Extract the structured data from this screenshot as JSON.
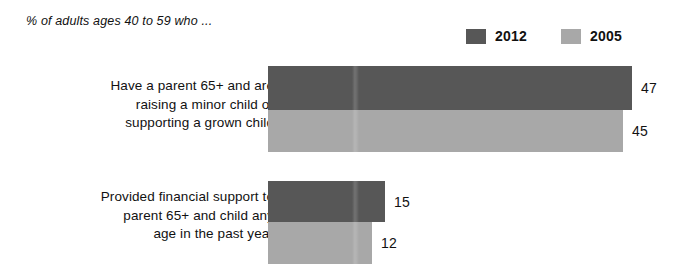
{
  "subtitle": "% of adults ages 40 to 59 who ...",
  "legend": {
    "entries": [
      {
        "label": "2012",
        "color": "#575757",
        "swatch_name": "legend-swatch-2012"
      },
      {
        "label": "2005",
        "color": "#a8a8a8",
        "swatch_name": "legend-swatch-2005"
      }
    ]
  },
  "chart_data": {
    "type": "bar",
    "orientation": "horizontal",
    "title": "",
    "subtitle": "% of adults ages 40 to 59 who ...",
    "xlabel": "",
    "ylabel": "",
    "grid": false,
    "legend_position": "top-right",
    "xlim": [
      0,
      47
    ],
    "categories": [
      "Have a parent 65+ and are raising a minor child or supporting a grown child",
      "Provided financial support to parent 65+ and child any age in the past year"
    ],
    "series": [
      {
        "name": "2012",
        "color": "#575757",
        "values": [
          47,
          15
        ]
      },
      {
        "name": "2005",
        "color": "#a8a8a8",
        "values": [
          45,
          12
        ]
      }
    ]
  },
  "groups": [
    {
      "label_line_1": "Have a parent 65+ and are",
      "label_line_2": "raising a minor child or",
      "label_line_3": "supporting a grown child",
      "bars": [
        {
          "series": "2012",
          "value": "47",
          "width_px": 364,
          "color": "#575757"
        },
        {
          "series": "2005",
          "value": "45",
          "width_px": 355,
          "color": "#a8a8a8"
        }
      ]
    },
    {
      "label_line_1": "Provided financial support to",
      "label_line_2": "parent 65+ and child any",
      "label_line_3": "age in the past year",
      "bars": [
        {
          "series": "2012",
          "value": "15",
          "width_px": 117,
          "color": "#575757"
        },
        {
          "series": "2005",
          "value": "12",
          "width_px": 104,
          "color": "#a8a8a8"
        }
      ]
    }
  ]
}
